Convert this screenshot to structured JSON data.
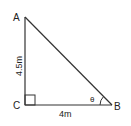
{
  "diagram": {
    "vertices": {
      "A": {
        "label": "A"
      },
      "B": {
        "label": "B"
      },
      "C": {
        "label": "C"
      }
    },
    "sides": {
      "AC": {
        "label": "4.5m"
      },
      "CB": {
        "label": "4m"
      }
    },
    "angle_B": {
      "label": "θ"
    },
    "right_angle_at": "C",
    "stroke_color": "#333333"
  }
}
